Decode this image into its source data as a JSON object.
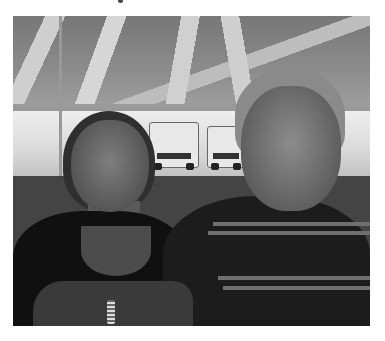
{
  "page": {
    "top_text_fragment": "",
    "photo": {
      "description": "Grayscale photo of a woman and an older man seated under a striped tent, white trucks parked in the background",
      "subjects": [
        "woman",
        "man"
      ],
      "colors": {
        "background": "#ffffff",
        "photo_tone": "grayscale"
      }
    }
  }
}
